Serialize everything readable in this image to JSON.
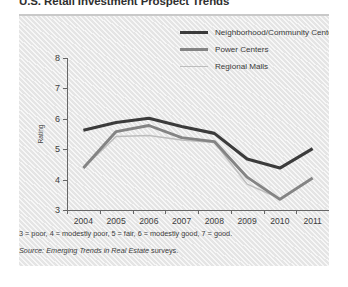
{
  "title": "U.S. Retail Investment Prospect Trends",
  "legend": {
    "position": "top-right",
    "items": [
      {
        "label": "Neighborhood/Community Centers",
        "color": "#3b3b3b",
        "icon": "line-swatch-icon"
      },
      {
        "label": "Power Centers",
        "color": "#848484",
        "icon": "line-swatch-icon"
      },
      {
        "label": "Regional Malls",
        "color": "#bdbdbd",
        "icon": "line-swatch-icon"
      }
    ]
  },
  "notes": {
    "scale": "3 = poor, 4 = modestly poor, 5 = fair, 6 = modestly good, 7 = good.",
    "source_lead": "Source:",
    "source_work": "Emerging Trends in Real Estate",
    "source_tail": "surveys."
  },
  "chart_data": {
    "type": "line",
    "title": "U.S. Retail Investment Prospect Trends",
    "xlabel": "",
    "ylabel": "Rating",
    "categories": [
      "2004",
      "2005",
      "2006",
      "2007",
      "2008",
      "2009",
      "2010",
      "2011"
    ],
    "x": [
      2004,
      2005,
      2006,
      2007,
      2008,
      2009,
      2010,
      2011
    ],
    "ylim": [
      3,
      8
    ],
    "yticks": [
      3,
      4,
      5,
      6,
      7,
      8
    ],
    "ytick_labels": [
      "3",
      "4",
      "5",
      "6",
      "7",
      "8"
    ],
    "xtick_labels": [
      "2004",
      "2005",
      "2006",
      "2007",
      "2008",
      "2009",
      "2010",
      "2011"
    ],
    "grid": false,
    "legend_position": "top-right",
    "series": [
      {
        "name": "Neighborhood/Community Centers",
        "color": "#3b3b3b",
        "width": 3.1,
        "values": [
          5.62,
          5.88,
          6.02,
          5.75,
          5.52,
          4.68,
          4.38,
          5.02
        ]
      },
      {
        "name": "Power Centers",
        "color": "#848484",
        "width": 2.9,
        "values": [
          4.38,
          5.58,
          5.78,
          5.38,
          5.25,
          4.08,
          3.35,
          4.05
        ]
      },
      {
        "name": "Regional Malls",
        "color": "#bdbdbd",
        "width": 1.5,
        "values": [
          4.38,
          5.42,
          5.45,
          5.3,
          5.22,
          3.85,
          3.38,
          4.05
        ]
      }
    ]
  }
}
